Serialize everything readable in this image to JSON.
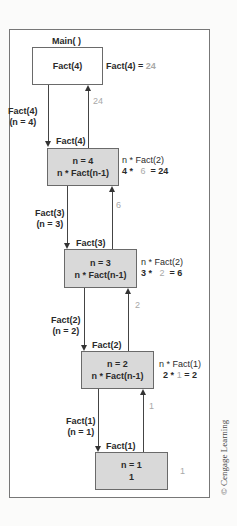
{
  "diagram": {
    "title": "Main( )",
    "main_box": {
      "label": "Fact(4)",
      "result_label": "Fact(4) =",
      "result_value": "24"
    },
    "return_values": [
      "24",
      "6",
      "2",
      "1"
    ],
    "calls": [
      {
        "call": "Fact(4)",
        "param": "(n = 4)",
        "entry_label": "Fact(4)"
      },
      {
        "call": "Fact(3)",
        "param": "(n = 3)",
        "entry_label": "Fact(3)"
      },
      {
        "call": "Fact(2)",
        "param": "(n = 2)",
        "entry_label": "Fact(2)"
      },
      {
        "call": "Fact(1)",
        "param": "(n = 1)",
        "entry_label": "Fact(1)"
      }
    ],
    "frames": [
      {
        "line1": "n = 4",
        "line2": "n * Fact(n-1)",
        "note1": "n * Fact(2)",
        "note2_a": "4 *",
        "note2_b": "6",
        "note2_c": "= 24"
      },
      {
        "line1": "n = 3",
        "line2": "n * Fact(n-1)",
        "note1": "n * Fact(2)",
        "note2_a": "3 *",
        "note2_b": "2",
        "note2_c": "= 6"
      },
      {
        "line1": "n = 2",
        "line2": "n * Fact(n-1)",
        "note1": "n * Fact(1)",
        "note2_a": "2 *",
        "note2_b": "1",
        "note2_c": "= 2"
      },
      {
        "line1": "n = 1",
        "line2": "1",
        "note1": "1"
      }
    ],
    "credit": "© Cengage Learning"
  }
}
